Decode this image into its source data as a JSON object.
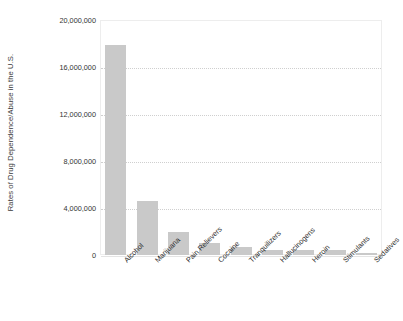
{
  "chart_data": {
    "type": "bar",
    "title": "",
    "xlabel": "",
    "ylabel": "Rates of Drug Dependence/Abuse in the U.S.",
    "ylim": [
      0,
      20000000
    ],
    "grid": true,
    "legend": false,
    "bar_color": "#c9c9c9",
    "categories": [
      "Alcohol",
      "Marijuana",
      "Pain Relievers",
      "Cocaine",
      "Tranquilizers",
      "Hallucinogens",
      "Heroin",
      "Stimulants",
      "Sedatives"
    ],
    "values": [
      17900000,
      4600000,
      2000000,
      1000000,
      700000,
      400000,
      400000,
      400000,
      150000
    ],
    "y_ticks": [
      0,
      4000000,
      8000000,
      12000000,
      16000000,
      20000000
    ],
    "y_tick_labels": [
      "0",
      "4,000,000",
      "8,000,000",
      "12,000,000",
      "16,000,000",
      "20,000,000"
    ]
  }
}
